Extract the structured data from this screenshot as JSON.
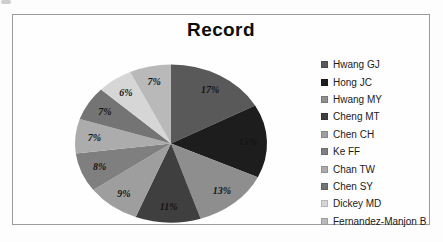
{
  "frame": {
    "border_color": "#9b9b9b",
    "background": "#fefefe"
  },
  "chart_data": {
    "type": "pie",
    "title": "Record",
    "legend_position": "right",
    "data_labels": "percent",
    "start_angle_deg": 0,
    "direction": "clockwise",
    "slices": [
      {
        "label": "Hwang GJ",
        "value": 17,
        "percent_label": "17%",
        "color": "#595959"
      },
      {
        "label": "Hong JC",
        "value": 15,
        "percent_label": "15%",
        "color": "#1d1d1d"
      },
      {
        "label": "Hwang MY",
        "value": 13,
        "percent_label": "13%",
        "color": "#8e8e8e"
      },
      {
        "label": "Cheng MT",
        "value": 11,
        "percent_label": "11%",
        "color": "#3f3f3f"
      },
      {
        "label": "Chen CH",
        "value": 9,
        "percent_label": "9%",
        "color": "#9e9e9e"
      },
      {
        "label": "Ke FF",
        "value": 8,
        "percent_label": "8%",
        "color": "#7f7f7f"
      },
      {
        "label": "Chan TW",
        "value": 7,
        "percent_label": "7%",
        "color": "#acacac"
      },
      {
        "label": "Chen SY",
        "value": 7,
        "percent_label": "7%",
        "color": "#747474"
      },
      {
        "label": "Dickey MD",
        "value": 6,
        "percent_label": "6%",
        "color": "#d6d6d6"
      },
      {
        "label": "Fernandez-Manjon B",
        "value": 7,
        "percent_label": "7%",
        "color": "#b9b9b9"
      }
    ]
  }
}
